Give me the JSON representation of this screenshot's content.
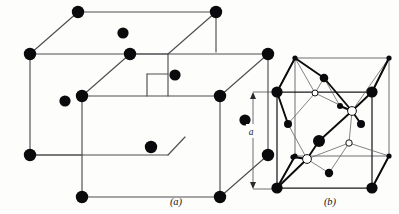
{
  "figure": {
    "background_color": "#fdfdfb",
    "ink_color": "#0a090c",
    "line_color": "#4e4e52",
    "width": 399,
    "height": 214
  },
  "panels": [
    {
      "id": "a",
      "caption": "(a)",
      "caption_x": 176,
      "caption_y": 205,
      "description": "two interpenetrating body-centred cubic unit cells",
      "atom_kind": "filled",
      "atom_count": 16
    },
    {
      "id": "b",
      "caption": "(b)",
      "caption_x": 330,
      "caption_y": 205,
      "description": "diamond-type cubic unit cell with tetrahedral bonding",
      "atom_kinds": [
        "large-filled",
        "small-filled",
        "open"
      ],
      "dimension": {
        "label": "a",
        "label_x": 250,
        "label_y": 131,
        "axis_x": 253,
        "top_y": 92,
        "bottom_y": 189
      }
    }
  ],
  "panel_a": {
    "cube_back": {
      "front_top_left": [
        30,
        54
      ],
      "front_top_right": [
        168,
        54
      ],
      "front_bottom_left": [
        30,
        155
      ],
      "front_bottom_right": [
        168,
        155
      ],
      "back_top_left": [
        78,
        12
      ],
      "back_top_right": [
        216,
        12
      ],
      "back_bottom_left": [
        78,
        113
      ],
      "back_bottom_right": [
        216,
        113
      ]
    },
    "cube_front": {
      "front_top_left": [
        82,
        96
      ],
      "front_top_right": [
        220,
        96
      ],
      "front_bottom_left": [
        82,
        197
      ],
      "front_bottom_right": [
        220,
        197
      ],
      "back_top_left": [
        130,
        54
      ],
      "back_top_right": [
        268,
        54
      ],
      "back_bottom_left": [
        130,
        155
      ],
      "back_bottom_right": [
        268,
        155
      ]
    },
    "atoms": [
      {
        "x": 30,
        "y": 54,
        "r": 6.2,
        "label": "corner"
      },
      {
        "x": 78,
        "y": 12,
        "r": 6.2,
        "label": "corner"
      },
      {
        "x": 216,
        "y": 12,
        "r": 6.2,
        "label": "corner"
      },
      {
        "x": 30,
        "y": 155,
        "r": 6.2,
        "label": "corner"
      },
      {
        "x": 123,
        "y": 33,
        "r": 5.6,
        "label": "body-centre"
      },
      {
        "x": 130,
        "y": 54,
        "r": 6.2,
        "label": "corner"
      },
      {
        "x": 82,
        "y": 96,
        "r": 6.2,
        "label": "corner"
      },
      {
        "x": 65,
        "y": 101,
        "r": 5.6,
        "label": "corner"
      },
      {
        "x": 268,
        "y": 54,
        "r": 6.2,
        "label": "corner"
      },
      {
        "x": 220,
        "y": 96,
        "r": 6.2,
        "label": "corner"
      },
      {
        "x": 175,
        "y": 75,
        "r": 5.6,
        "label": "body-centre"
      },
      {
        "x": 245,
        "y": 120,
        "r": 5.6,
        "label": "face"
      },
      {
        "x": 268,
        "y": 155,
        "r": 6.2,
        "label": "corner"
      },
      {
        "x": 151,
        "y": 147,
        "r": 6.2,
        "label": "body-centre"
      },
      {
        "x": 82,
        "y": 197,
        "r": 6.2,
        "label": "corner"
      },
      {
        "x": 220,
        "y": 197,
        "r": 6.2,
        "label": "corner"
      }
    ]
  },
  "panel_b": {
    "cube": {
      "front_bottom_left": [
        277,
        188
      ],
      "front_bottom_right": [
        372,
        188
      ],
      "front_top_left": [
        277,
        92
      ],
      "front_top_right": [
        372,
        92
      ],
      "back_bottom_left": [
        295,
        156
      ],
      "back_bottom_right": [
        389,
        156
      ],
      "back_top_left": [
        295,
        58
      ],
      "back_top_right": [
        389,
        58
      ]
    },
    "atoms": [
      {
        "x": 277,
        "y": 92,
        "r": 5.6,
        "kind": "large-filled",
        "label": "corner-front-top-left"
      },
      {
        "x": 372,
        "y": 92,
        "r": 5.6,
        "kind": "large-filled",
        "label": "corner-front-top-right"
      },
      {
        "x": 277,
        "y": 188,
        "r": 5.6,
        "kind": "large-filled",
        "label": "corner-front-bottom-left"
      },
      {
        "x": 372,
        "y": 188,
        "r": 5.6,
        "kind": "large-filled",
        "label": "corner-front-bottom-right"
      },
      {
        "x": 295,
        "y": 58,
        "r": 2.6,
        "kind": "small-filled",
        "label": "corner-back-top-left"
      },
      {
        "x": 389,
        "y": 58,
        "r": 2.6,
        "kind": "small-filled",
        "label": "corner-back-top-right"
      },
      {
        "x": 295,
        "y": 156,
        "r": 2.6,
        "kind": "small-filled",
        "label": "corner-back-bottom-left"
      },
      {
        "x": 389,
        "y": 156,
        "r": 2.6,
        "kind": "small-filled",
        "label": "corner-back-bottom-right"
      },
      {
        "x": 324,
        "y": 78,
        "r": 4.3,
        "kind": "mid-filled",
        "label": "face-centre-top"
      },
      {
        "x": 288,
        "y": 124,
        "r": 4.0,
        "kind": "mid-filled",
        "label": "face-centre-left"
      },
      {
        "x": 361,
        "y": 124,
        "r": 4.0,
        "kind": "mid-filled",
        "label": "face-centre-right"
      },
      {
        "x": 329,
        "y": 173,
        "r": 4.2,
        "kind": "mid-filled",
        "label": "face-centre-bottom"
      },
      {
        "x": 319,
        "y": 141,
        "r": 6.0,
        "kind": "large-filled",
        "label": "tetrahedral-interior"
      },
      {
        "x": 340,
        "y": 106,
        "r": 3.0,
        "kind": "small-filled",
        "label": "interior-small-upper"
      },
      {
        "x": 293,
        "y": 157,
        "r": 2.6,
        "kind": "small-filled",
        "label": "interior-small-lower"
      },
      {
        "x": 315,
        "y": 93,
        "r": 3.0,
        "kind": "open",
        "label": "open-upper-left"
      },
      {
        "x": 352,
        "y": 111,
        "r": 4.4,
        "kind": "open",
        "label": "open-upper-right"
      },
      {
        "x": 307,
        "y": 159,
        "r": 4.4,
        "kind": "open",
        "label": "open-lower-left"
      },
      {
        "x": 349,
        "y": 143,
        "r": 3.2,
        "kind": "open",
        "label": "open-lower-right"
      }
    ]
  }
}
